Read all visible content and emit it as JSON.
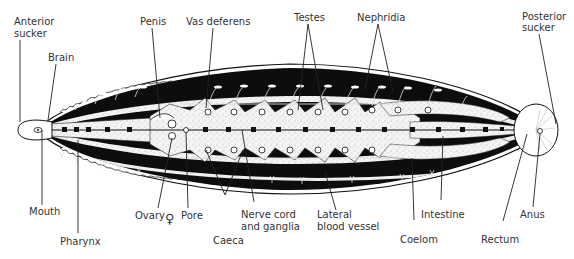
{
  "figure": {
    "labels": {
      "anterior_sucker_1": "Anterior",
      "anterior_sucker_2": "sucker",
      "brain": "Brain",
      "penis": "Penis",
      "vas_deferens": "Vas deferens",
      "testes": "Testes",
      "nephridia": "Nephridia",
      "posterior_sucker_1": "Posterior",
      "posterior_sucker_2": "sucker",
      "mouth": "Mouth",
      "pharynx": "Pharynx",
      "ovary": "Ovary",
      "female_symbol": "♀",
      "pore": "Pore",
      "caeca": "Caeca",
      "nerve_cord_1": "Nerve cord",
      "nerve_cord_2": "and ganglia",
      "lateral_vessel_1": "Lateral",
      "lateral_vessel_2": "blood vessel",
      "coelom": "Coelom",
      "intestine": "Intestine",
      "rectum": "Rectum",
      "anus": "Anus"
    },
    "colors": {
      "ink": "#111111",
      "body_fill": "#f2f2f2",
      "label_text": "#333333"
    }
  }
}
